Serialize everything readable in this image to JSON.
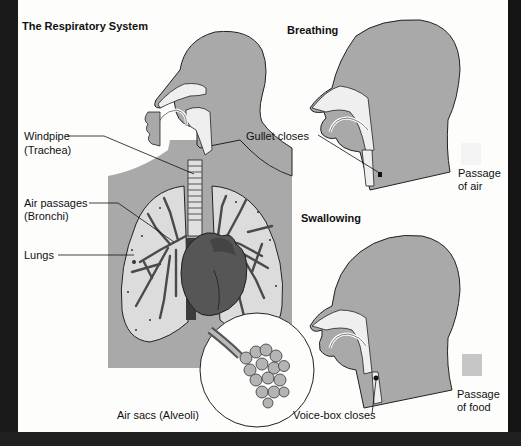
{
  "figure": {
    "title": "The Respiratory System",
    "colors": {
      "tissue": "#a9a9a9",
      "airway": "#f2f2f2",
      "lung": "#dcdcdc",
      "heart": "#555555",
      "frame": "#161616",
      "passage_air_swatch": "#f4f4f4",
      "passage_food_swatch": "#c6c6c6"
    }
  },
  "main_diagram": {
    "labels": {
      "windpipe": "Windpipe",
      "windpipe_sub": "(Trachea)",
      "air_passages": "Air passages",
      "air_passages_sub": "(Bronchi)",
      "lungs": "Lungs",
      "air_sacs": "Air sacs (Alveoli)"
    }
  },
  "breathing_panel": {
    "title": "Breathing",
    "callout": "Gullet closes",
    "legend_line1": "Passage",
    "legend_line2": "of air"
  },
  "swallowing_panel": {
    "title": "Swallowing",
    "callout": "Voice-box closes",
    "legend_line1": "Passage",
    "legend_line2": "of food"
  }
}
